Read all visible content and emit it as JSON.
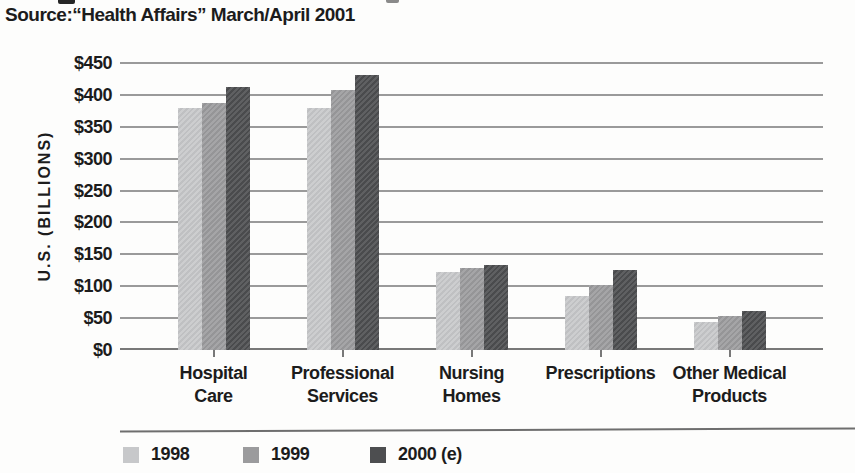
{
  "source_line": "Source:“Health Affairs” March/April 2001",
  "chart_data": {
    "type": "bar",
    "title": "",
    "categories": [
      "Hospital Care",
      "Professional Services",
      "Nursing Homes",
      "Prescriptions",
      "Other Medical Products"
    ],
    "category_display": [
      "Hospital\nCare",
      "Professional\nServices",
      "Nursing\nHomes",
      "Prescriptions",
      "Other Medical\nProducts"
    ],
    "series": [
      {
        "name": "1998",
        "color": "#c7c8ca",
        "values": [
          380,
          380,
          123,
          85,
          44
        ]
      },
      {
        "name": "1999",
        "color": "#9b9b9d",
        "values": [
          388,
          407,
          128,
          102,
          54
        ]
      },
      {
        "name": "2000 (e)",
        "color": "#4d4e50",
        "values": [
          413,
          431,
          134,
          125,
          62
        ]
      }
    ],
    "xlabel": "",
    "ylabel": "U.S. (BILLIONS)",
    "ylim": [
      0,
      450
    ],
    "ytick_step": 50,
    "ytick_labels": [
      "$0",
      "$50",
      "$100",
      "$150",
      "$200",
      "$250",
      "$300",
      "$350",
      "$400",
      "$450"
    ],
    "grid": true,
    "legend_position": "bottom"
  },
  "colors": {
    "gridline": "#9a9a9a",
    "axis_line": "#787878",
    "text": "#1c1c1c",
    "background": "#fdfdfc"
  }
}
